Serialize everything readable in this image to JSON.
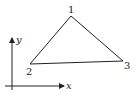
{
  "diagram": {
    "type": "triangle-element",
    "nodes": [
      {
        "id": "1",
        "label": "1",
        "x": 71,
        "y": 16
      },
      {
        "id": "2",
        "label": "2",
        "x": 30,
        "y": 64
      },
      {
        "id": "3",
        "label": "3",
        "x": 123,
        "y": 61
      }
    ],
    "edges": [
      [
        "1",
        "2"
      ],
      [
        "2",
        "3"
      ],
      [
        "3",
        "1"
      ]
    ],
    "axes": {
      "x_label": "x",
      "y_label": "y"
    },
    "colors": {
      "stroke": "#222222",
      "background": "#ffffff"
    }
  }
}
